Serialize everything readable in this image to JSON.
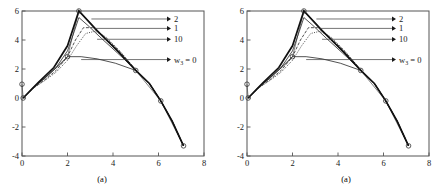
{
  "figure": {
    "panels": [
      {
        "id": "left",
        "caption": "(a)"
      },
      {
        "id": "right",
        "caption": "(a)"
      }
    ]
  },
  "chart_data": {
    "type": "line",
    "title": "",
    "xlabel": "",
    "ylabel": "",
    "xlim": [
      0,
      8
    ],
    "ylim": [
      -4,
      6
    ],
    "xticks": [
      0,
      2,
      4,
      6,
      8
    ],
    "xticklabels": [
      "0",
      "2",
      "4",
      "6",
      "8"
    ],
    "yticks": [
      -4,
      -2,
      0,
      2,
      4,
      6
    ],
    "yticklabels": [
      "-4",
      "-2",
      "0",
      "2",
      "4",
      "6"
    ],
    "grid": false,
    "legend_position": "inline-annotations",
    "control_points": {
      "name": "control polygon",
      "x": [
        0.0,
        0.05,
        2.0,
        2.5,
        5.0,
        6.1,
        7.1
      ],
      "y": [
        0.95,
        0.0,
        2.85,
        6.0,
        1.9,
        -0.2,
        -3.3
      ],
      "marker": "circle"
    },
    "series": [
      {
        "name": "2",
        "weight_label": "2",
        "style": "solid-thin",
        "x": [
          0.05,
          0.5,
          1.0,
          1.5,
          2.0,
          2.3,
          2.5,
          2.9,
          3.5,
          4.2,
          5.0,
          5.6,
          6.1,
          6.6,
          7.1
        ],
        "y": [
          0.0,
          0.75,
          1.35,
          2.1,
          3.25,
          4.6,
          5.55,
          5.0,
          4.1,
          3.1,
          1.95,
          1.0,
          -0.2,
          -1.6,
          -3.3
        ]
      },
      {
        "name": "1",
        "weight_label": "1",
        "style": "dashed",
        "x": [
          0.05,
          0.5,
          1.0,
          1.5,
          2.0,
          2.35,
          2.7,
          3.1,
          3.6,
          4.3,
          5.0,
          5.6,
          6.1,
          6.6,
          7.1
        ],
        "y": [
          0.0,
          0.7,
          1.25,
          1.9,
          2.85,
          4.0,
          4.85,
          4.85,
          4.25,
          3.2,
          1.95,
          1.0,
          -0.2,
          -1.6,
          -3.3
        ]
      },
      {
        "name": "10",
        "weight_label": "10",
        "style": "dotted",
        "x": [
          0.05,
          0.5,
          1.0,
          1.5,
          2.0,
          2.4,
          2.8,
          3.2,
          3.7,
          4.3,
          5.0,
          5.6,
          6.1,
          6.6,
          7.1
        ],
        "y": [
          0.0,
          0.68,
          1.2,
          1.78,
          2.6,
          3.6,
          4.45,
          4.6,
          4.2,
          3.25,
          1.95,
          1.0,
          -0.2,
          -1.6,
          -3.3
        ]
      },
      {
        "name": "w3 = 0",
        "weight_label": "w₃ = 0",
        "style": "polygon-thin",
        "x": [
          0.05,
          0.6,
          1.2,
          1.7,
          2.0,
          2.6,
          3.3,
          4.1,
          5.0,
          5.6,
          6.1,
          6.6,
          7.1
        ],
        "y": [
          0.0,
          0.85,
          1.65,
          2.35,
          2.85,
          2.85,
          2.7,
          2.4,
          1.9,
          1.0,
          -0.2,
          -1.6,
          -3.3
        ]
      },
      {
        "name": "upper-envelope",
        "weight_label": "",
        "style": "solid-thick",
        "x": [
          0.05,
          0.7,
          1.4,
          2.0,
          2.5,
          3.3,
          4.2,
          5.0,
          5.6,
          6.1,
          6.6,
          7.1
        ],
        "y": [
          0.0,
          1.05,
          2.1,
          3.6,
          6.0,
          4.65,
          3.25,
          1.9,
          1.0,
          -0.2,
          -1.6,
          -3.3
        ]
      }
    ],
    "annotations": [
      {
        "label": "2",
        "sub": "",
        "eq": "",
        "arrow_from_x": 3.05,
        "arrow_from_y": 5.45,
        "arrow_to_x": 6.55,
        "arrow_to_y": 5.45
      },
      {
        "label": "1",
        "sub": "",
        "eq": "",
        "arrow_from_x": 3.2,
        "arrow_from_y": 4.8,
        "arrow_to_x": 6.55,
        "arrow_to_y": 4.8
      },
      {
        "label": "10",
        "sub": "",
        "eq": "",
        "arrow_from_x": 3.3,
        "arrow_from_y": 4.05,
        "arrow_to_x": 6.55,
        "arrow_to_y": 4.05
      },
      {
        "label": "w",
        "sub": "3",
        "eq": " = 0",
        "arrow_from_x": 2.6,
        "arrow_from_y": 2.65,
        "arrow_to_x": 6.55,
        "arrow_to_y": 2.65
      }
    ]
  }
}
